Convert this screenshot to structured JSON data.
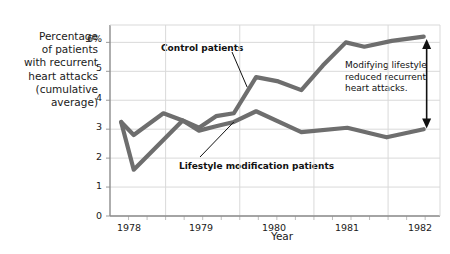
{
  "chart_data": {
    "type": "line",
    "title": "",
    "xlabel": "Year",
    "ylabel": "Percentage of patients with recurrent heart attacks (cumulative average)",
    "ylabel_lines": [
      "Percentage",
      "of patients",
      "with recurrent",
      "heart attacks",
      "(cumulative",
      "average)"
    ],
    "xlim": [
      1977.75,
      1982.2
    ],
    "ylim": [
      0,
      6.6
    ],
    "yticks": [
      0,
      1,
      2,
      3,
      4,
      5,
      6
    ],
    "ytick_labels": [
      "0",
      "1",
      "2",
      "3",
      "4",
      "5",
      "6%"
    ],
    "xticks": [
      1978,
      1979,
      1980,
      1981,
      1982
    ],
    "xtick_labels": [
      "1978",
      "1979",
      "1980",
      "1981",
      "1982"
    ],
    "x_minor_tick_step": 0.25,
    "grid": true,
    "grid_color": "#d9d9d9",
    "legend_position": "inline-annotations",
    "series": [
      {
        "name": "Control patients",
        "color": "#6e6e6e",
        "x": [
          1977.9,
          1978.07,
          1978.47,
          1978.73,
          1978.95,
          1979.18,
          1979.42,
          1979.72,
          1980.02,
          1980.33,
          1980.62,
          1980.93,
          1981.18,
          1981.55,
          1981.98
        ],
        "y": [
          3.25,
          2.8,
          3.55,
          3.3,
          3.05,
          3.45,
          3.55,
          4.8,
          4.65,
          4.35,
          5.2,
          6.0,
          5.85,
          6.05,
          6.2
        ]
      },
      {
        "name": "Lifestyle modification patients",
        "color": "#6e6e6e",
        "x": [
          1977.9,
          1978.07,
          1978.73,
          1978.95,
          1979.18,
          1979.42,
          1979.72,
          1980.33,
          1980.95,
          1981.48,
          1981.98
        ],
        "y": [
          3.25,
          1.6,
          3.3,
          2.95,
          3.1,
          3.25,
          3.62,
          2.9,
          3.05,
          2.72,
          3.0
        ]
      }
    ],
    "annotations": [
      {
        "name": "control-patients-callout",
        "text": "Control patients",
        "target_x": 1979.6,
        "target_y": 4.45
      },
      {
        "name": "lifestyle-patients-callout",
        "text": "Lifestyle modification patients",
        "target_x": 1979.42,
        "target_y": 3.25
      },
      {
        "name": "difference-note",
        "text_lines": [
          "Modifying lifestyle",
          "reduced recurrent",
          "heart attacks."
        ],
        "arrow_x": 1982.02,
        "arrow_top_y": 6.12,
        "arrow_bottom_y": 3.02
      }
    ]
  }
}
